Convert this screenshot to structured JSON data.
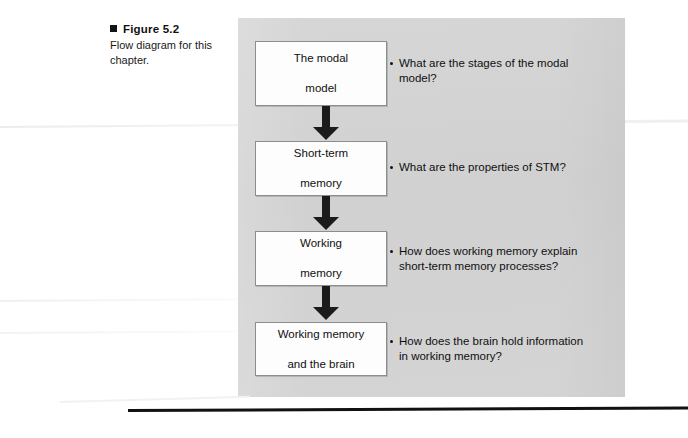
{
  "figure": {
    "marker_icon": "black-square-marker",
    "number_label": "Figure 5.2",
    "description": "Flow diagram for this chapter."
  },
  "diagram": {
    "panel_color": "#d3d3d3",
    "box_fill": "#fdfdfd",
    "box_border": "#8d8d8d",
    "arrow_color": "#1b1b1b",
    "arrow_icon": "down-arrow-icon",
    "bullet_icon": "bullet-dot-icon",
    "steps": [
      {
        "box_line1": "The modal",
        "box_line2": "model",
        "question_line1": "What are the stages of the modal",
        "question_line2": "model?"
      },
      {
        "box_line1": "Short-term",
        "box_line2": "memory",
        "question_line1": "What are the properties of STM?",
        "question_line2": ""
      },
      {
        "box_line1": "Working",
        "box_line2": "memory",
        "question_line1": "How does working memory explain",
        "question_line2": "short-term memory processes?"
      },
      {
        "box_line1": "Working memory",
        "box_line2": "and the brain",
        "question_line1": "How does the brain hold information",
        "question_line2": "in working memory?"
      }
    ]
  }
}
